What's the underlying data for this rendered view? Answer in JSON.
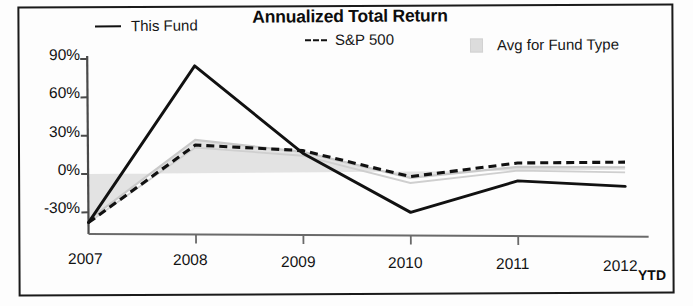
{
  "chart_data": {
    "type": "line",
    "title": "Annualized Total Return",
    "xlabel": "",
    "ylabel": "",
    "categories": [
      "2007",
      "2008",
      "2009",
      "2010",
      "2011",
      "2012"
    ],
    "x_tick_suffix_label": "YTD",
    "y_ticks": [
      "90%",
      "60%",
      "30%",
      "0%",
      "-30%"
    ],
    "y_tick_values": [
      90,
      60,
      30,
      0,
      -30
    ],
    "ylim": [
      -40,
      95
    ],
    "grid": false,
    "legend_position": "top",
    "series": [
      {
        "name": "This Fund",
        "style": "solid",
        "color": "#111111",
        "values": [
          -38,
          84,
          15,
          -32,
          -8,
          -13
        ]
      },
      {
        "name": "S&P 500",
        "style": "dashed",
        "color": "#111111",
        "values": [
          -38,
          22,
          17,
          -4,
          6,
          6
        ]
      },
      {
        "name": "Avg for Fund Type",
        "style": "band",
        "color": "#dcdcdc",
        "values": [
          -37,
          26,
          16,
          -7,
          2,
          1
        ],
        "band_lower": [
          -38,
          20,
          13,
          -9,
          0,
          -2
        ],
        "band_upper": [
          -36,
          26,
          16,
          -5,
          3,
          2
        ]
      }
    ]
  },
  "title": {
    "text": "Annualized Total Return"
  },
  "legend": {
    "items": [
      {
        "label": "This Fund",
        "marker": "solid-line-icon"
      },
      {
        "label": "S&P 500",
        "marker": "dashed-line-icon"
      },
      {
        "label": "Avg for Fund Type",
        "marker": "gray-swatch-icon"
      }
    ]
  },
  "axes": {
    "y_labels": [
      "90%",
      "60%",
      "30%",
      "0%",
      "-30%"
    ],
    "x_labels": [
      "2007",
      "2008",
      "2009",
      "2010",
      "2011",
      "2012"
    ],
    "ytd": "YTD"
  }
}
